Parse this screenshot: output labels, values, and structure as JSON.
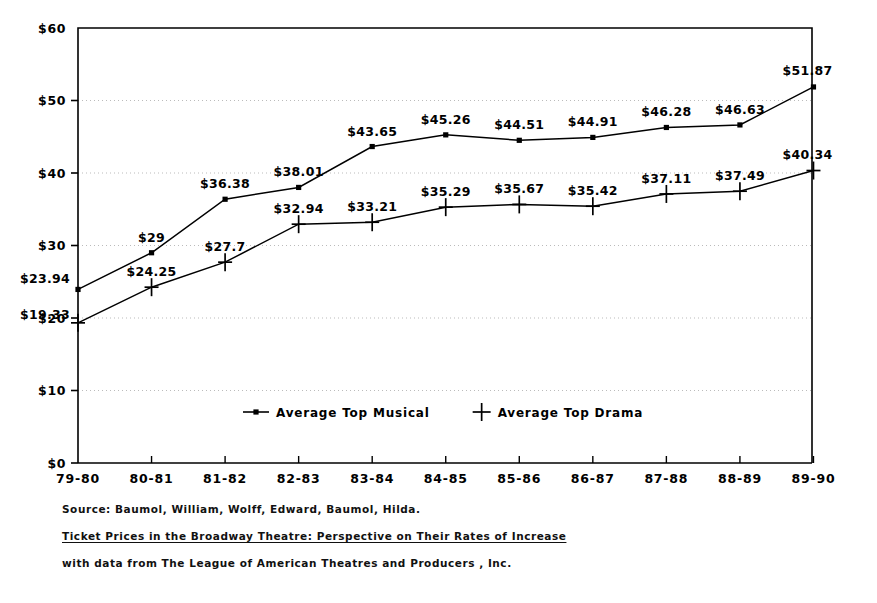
{
  "chart_data": {
    "type": "line",
    "title": "",
    "xlabel": "",
    "ylabel": "",
    "ylim": [
      0,
      60
    ],
    "ytick_labels": [
      "$0",
      "$10",
      "$20",
      "$30",
      "$40",
      "$50",
      "$60"
    ],
    "ytick_values": [
      0,
      10,
      20,
      30,
      40,
      50,
      60
    ],
    "grid": true,
    "grid_style": "dotted-horizontal",
    "legend_position": "inside-bottom-center",
    "categories": [
      "79-80",
      "80-81",
      "81-82",
      "82-83",
      "83-84",
      "84-85",
      "85-86",
      "86-87",
      "87-88",
      "88-89",
      "89-90"
    ],
    "series": [
      {
        "name": "Average Top Musical",
        "marker": "square",
        "values": [
          23.94,
          29,
          36.38,
          38.01,
          43.65,
          45.26,
          44.51,
          44.91,
          46.28,
          46.63,
          51.87
        ],
        "point_labels": [
          "$23.94",
          "$29",
          "$36.38",
          "$38.01",
          "$43.65",
          "$45.26",
          "$44.51",
          "$44.91",
          "$46.28",
          "$46.63",
          "$51.87"
        ]
      },
      {
        "name": "Average Top Drama",
        "marker": "plus",
        "values": [
          19.33,
          24.25,
          27.7,
          32.94,
          33.21,
          35.29,
          35.67,
          35.42,
          37.11,
          37.49,
          40.34
        ],
        "point_labels": [
          "$19.33",
          "$24.25",
          "$27.7",
          "$32.94",
          "$33.21",
          "$35.29",
          "$35.67",
          "$35.42",
          "$37.11",
          "$37.49",
          "$40.34"
        ]
      }
    ]
  },
  "legend": {
    "items": [
      {
        "label": "Average Top Musical",
        "marker": "square"
      },
      {
        "label": "Average Top Drama",
        "marker": "plus"
      }
    ]
  },
  "source": {
    "line1": "Source: Baumol, William, Wolff, Edward, Baumol, Hilda.",
    "line2": "Ticket Prices in the Broadway Theatre: Perspective on Their Rates of Increase",
    "line3": "with data from The League of American Theatres and Producers , Inc."
  },
  "colors": {
    "ink": "#000000",
    "grid": "#bbbbbb",
    "background": "#ffffff"
  }
}
